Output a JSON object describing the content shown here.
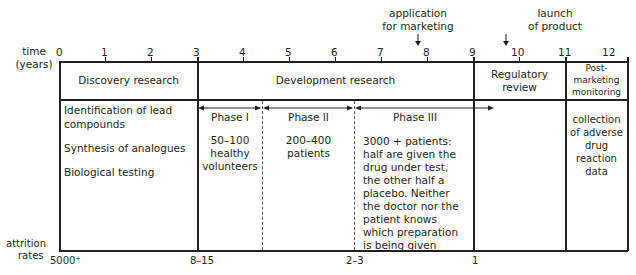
{
  "axis": {
    "label_line1": "time",
    "label_line2": "(years)",
    "ticks": [
      "0",
      "1",
      "2",
      "3",
      "4",
      "5",
      "6",
      "7",
      "8",
      "9",
      "10",
      "11",
      "12"
    ]
  },
  "annotations": {
    "application_line1": "application",
    "application_line2": "for marketing",
    "launch_line1": "launch",
    "launch_line2": "of product"
  },
  "stages": {
    "discovery": "Discovery research",
    "development": "Development research",
    "regulatory_line1": "Regulatory",
    "regulatory_line2": "review",
    "post_line1": "Post-",
    "post_line2": "marketing",
    "post_line3": "monitoring"
  },
  "discovery_details": {
    "item1_line1": "Identification of lead",
    "item1_line2": "compounds",
    "item2": "Synthesis of analogues",
    "item3": "Biological testing"
  },
  "phases": {
    "phase1": {
      "title": "Phase I",
      "line1": "50–100",
      "line2": "healthy",
      "line3": "volunteers"
    },
    "phase2": {
      "title": "Phase II",
      "line1": "200–400",
      "line2": "patients"
    },
    "phase3": {
      "title": "Phase III",
      "lines": [
        "3000 + patients:",
        "half are given the",
        "drug under test,",
        "the other half a",
        "placebo. Neither",
        "the doctor nor the",
        "patient knows",
        "which preparation",
        "is being given"
      ]
    }
  },
  "post_details": {
    "line1": "collection",
    "line2": "of adverse",
    "line3": "drug",
    "line4": "reaction",
    "line5": "data"
  },
  "attrition": {
    "label_line1": "attrition",
    "label_line2": "rates",
    "values": [
      "5000⁺",
      "8–15",
      "2–3",
      "1"
    ]
  }
}
